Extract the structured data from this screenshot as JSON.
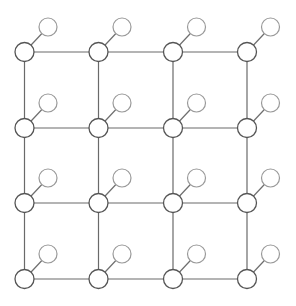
{
  "diagram": {
    "type": "grid-graph",
    "rows": 4,
    "cols": 4,
    "col_x": [
      24.5,
      98.5,
      173,
      247
    ],
    "row_y": [
      52,
      128,
      203,
      279
    ],
    "main_node_radius": 9.5,
    "aux_node_radius": 9,
    "aux_offset": {
      "dx": 23.5,
      "dy": -25
    },
    "colors": {
      "background": "#ffffff",
      "edge": "#6a6a6a",
      "main_node_stroke": "#555555",
      "aux_node_stroke": "#9a9a9a"
    }
  }
}
